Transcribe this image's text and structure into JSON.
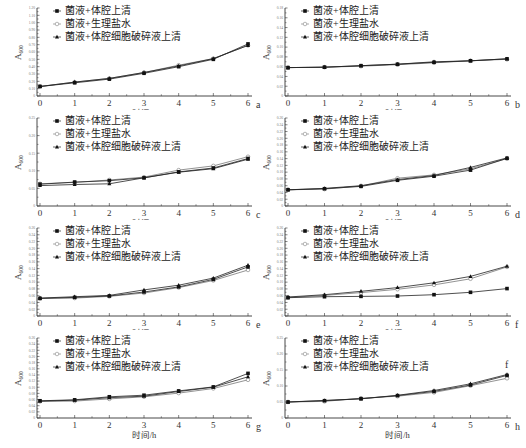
{
  "legend": [
    {
      "label": "菌液+体腔上清",
      "marker": "filled-square"
    },
    {
      "label": "菌液+生理盐水",
      "marker": "open-circle"
    },
    {
      "label": "菌液+体腔细胞破碎液上清",
      "marker": "filled-triangle"
    }
  ],
  "xlabel": "时间/h",
  "ylabel": "A600",
  "chart_data": [
    {
      "type": "line",
      "panel": "a",
      "x": [
        0,
        1,
        2,
        3,
        4,
        5,
        6
      ],
      "xlabel": "时间/h",
      "ylabel": "A600",
      "ylim": [
        0,
        1.2
      ],
      "yticks": [
        0,
        0.1,
        0.2,
        0.3,
        0.4,
        0.5,
        0.6,
        0.7,
        0.8,
        0.9,
        1.0,
        1.1,
        1.2
      ],
      "series": [
        {
          "name": "菌液+体腔上清",
          "values": [
            0.13,
            0.18,
            0.23,
            0.31,
            0.4,
            0.5,
            0.71
          ]
        },
        {
          "name": "菌液+生理盐水",
          "values": [
            0.13,
            0.19,
            0.24,
            0.32,
            0.42,
            0.51,
            0.69
          ]
        },
        {
          "name": "菌液+体腔细胞破碎液上清",
          "values": [
            0.13,
            0.19,
            0.24,
            0.32,
            0.41,
            0.51,
            0.69
          ]
        }
      ]
    },
    {
      "type": "line",
      "panel": "b",
      "x": [
        0,
        1,
        2,
        3,
        4,
        5,
        6
      ],
      "xlabel": "时间/h",
      "ylabel": "A600",
      "ylim": [
        0,
        0.18
      ],
      "yticks": [
        0,
        0.02,
        0.04,
        0.06,
        0.08,
        0.1,
        0.12,
        0.14,
        0.16,
        0.18
      ],
      "series": [
        {
          "name": "菌液+体腔上清",
          "values": [
            0.058,
            0.059,
            0.062,
            0.065,
            0.069,
            0.072,
            0.076
          ]
        },
        {
          "name": "菌液+生理盐水",
          "values": [
            0.058,
            0.059,
            0.061,
            0.064,
            0.068,
            0.072,
            0.075
          ]
        },
        {
          "name": "菌液+体腔细胞破碎液上清",
          "values": [
            0.058,
            0.059,
            0.062,
            0.065,
            0.07,
            0.072,
            0.076
          ]
        }
      ]
    },
    {
      "type": "line",
      "panel": "c",
      "x": [
        0,
        1,
        2,
        3,
        4,
        5,
        6
      ],
      "xlabel": "时间/h",
      "ylabel": "A600",
      "ylim": [
        0,
        0.25
      ],
      "yticks": [
        0,
        0.05,
        0.1,
        0.15,
        0.2,
        0.25
      ],
      "series": [
        {
          "name": "菌液+体腔上清",
          "values": [
            0.062,
            0.068,
            0.072,
            0.08,
            0.097,
            0.108,
            0.135
          ]
        },
        {
          "name": "菌液+生理盐水",
          "values": [
            0.063,
            0.067,
            0.074,
            0.082,
            0.102,
            0.114,
            0.14
          ]
        },
        {
          "name": "菌液+体腔细胞破碎液上清",
          "values": [
            0.058,
            0.061,
            0.063,
            0.08,
            0.096,
            0.106,
            0.133
          ]
        }
      ]
    },
    {
      "type": "line",
      "panel": "d",
      "x": [
        0,
        1,
        2,
        3,
        4,
        5,
        6
      ],
      "xlabel": "时间/h",
      "ylabel": "A600",
      "ylim": [
        0,
        0.26
      ],
      "yticks": [
        0,
        0.02,
        0.04,
        0.06,
        0.08,
        0.1,
        0.12,
        0.14,
        0.16,
        0.18,
        0.2,
        0.22,
        0.24,
        0.26
      ],
      "series": [
        {
          "name": "菌液+体腔上清",
          "values": [
            0.048,
            0.051,
            0.058,
            0.076,
            0.088,
            0.106,
            0.141
          ]
        },
        {
          "name": "菌液+生理盐水",
          "values": [
            0.048,
            0.05,
            0.059,
            0.082,
            0.092,
            0.11,
            0.14
          ]
        },
        {
          "name": "菌液+体腔细胞破碎液上清",
          "values": [
            0.048,
            0.052,
            0.06,
            0.078,
            0.09,
            0.114,
            0.142
          ]
        }
      ]
    },
    {
      "type": "line",
      "panel": "e",
      "x": [
        0,
        1,
        2,
        3,
        4,
        5,
        6
      ],
      "xlabel": "时间/h",
      "ylabel": "A600",
      "ylim": [
        0,
        0.26
      ],
      "yticks": [
        0,
        0.02,
        0.04,
        0.06,
        0.08,
        0.1,
        0.12,
        0.14,
        0.16,
        0.18,
        0.2,
        0.22,
        0.24,
        0.26
      ],
      "series": [
        {
          "name": "菌液+体腔上清",
          "values": [
            0.052,
            0.055,
            0.059,
            0.071,
            0.086,
            0.108,
            0.145
          ]
        },
        {
          "name": "菌液+生理盐水",
          "values": [
            0.052,
            0.053,
            0.058,
            0.068,
            0.084,
            0.105,
            0.136
          ]
        },
        {
          "name": "菌液+体腔细胞破碎液上清",
          "values": [
            0.053,
            0.057,
            0.061,
            0.077,
            0.091,
            0.112,
            0.15
          ]
        }
      ]
    },
    {
      "type": "line",
      "panel": "f",
      "x": [
        0,
        1,
        2,
        3,
        4,
        5,
        6
      ],
      "xlabel": "时间/h",
      "ylabel": "A600",
      "ylim": [
        0,
        0.26
      ],
      "yticks": [
        0,
        0.02,
        0.04,
        0.06,
        0.08,
        0.1,
        0.12,
        0.14,
        0.16,
        0.18,
        0.2,
        0.22,
        0.24,
        0.26
      ],
      "series": [
        {
          "name": "菌液+体腔上清",
          "values": [
            0.054,
            0.057,
            0.058,
            0.059,
            0.063,
            0.07,
            0.081
          ]
        },
        {
          "name": "菌液+生理盐水",
          "values": [
            0.055,
            0.061,
            0.069,
            0.079,
            0.092,
            0.11,
            0.145
          ]
        },
        {
          "name": "菌液+体腔细胞破碎液上清",
          "values": [
            0.056,
            0.063,
            0.073,
            0.084,
            0.098,
            0.117,
            0.147
          ]
        }
      ]
    },
    {
      "type": "line",
      "panel": "g",
      "x": [
        0,
        1,
        2,
        3,
        4,
        5,
        6
      ],
      "xlabel": "时间/h",
      "ylabel": "A600",
      "ylim": [
        0,
        0.26
      ],
      "yticks": [
        0,
        0.02,
        0.04,
        0.06,
        0.08,
        0.1,
        0.12,
        0.14,
        0.16,
        0.18,
        0.2,
        0.22,
        0.24,
        0.26
      ],
      "series": [
        {
          "name": "菌液+体腔上清",
          "values": [
            0.056,
            0.059,
            0.069,
            0.074,
            0.088,
            0.101,
            0.145
          ]
        },
        {
          "name": "菌液+生理盐水",
          "values": [
            0.054,
            0.055,
            0.062,
            0.069,
            0.081,
            0.096,
            0.124
          ]
        },
        {
          "name": "菌液+体腔细胞破碎液上清",
          "values": [
            0.055,
            0.058,
            0.066,
            0.071,
            0.086,
            0.1,
            0.134
          ]
        }
      ]
    },
    {
      "type": "line",
      "panel": "h",
      "x": [
        0,
        1,
        2,
        3,
        4,
        5,
        6
      ],
      "xlabel": "时间/h",
      "ylabel": "A600",
      "ylim": [
        0,
        0.25
      ],
      "yticks": [
        0,
        0.05,
        0.1,
        0.15,
        0.2,
        0.25
      ],
      "series": [
        {
          "name": "菌液+体腔上清",
          "values": [
            0.05,
            0.054,
            0.06,
            0.07,
            0.083,
            0.103,
            0.133
          ]
        },
        {
          "name": "菌液+生理盐水",
          "values": [
            0.05,
            0.052,
            0.062,
            0.068,
            0.08,
            0.101,
            0.124
          ]
        },
        {
          "name": "菌液+体腔细胞破碎液上清",
          "values": [
            0.05,
            0.055,
            0.06,
            0.071,
            0.086,
            0.107,
            0.136
          ]
        }
      ]
    }
  ],
  "extra_labels": [
    {
      "panel": "h",
      "text": "f"
    }
  ]
}
